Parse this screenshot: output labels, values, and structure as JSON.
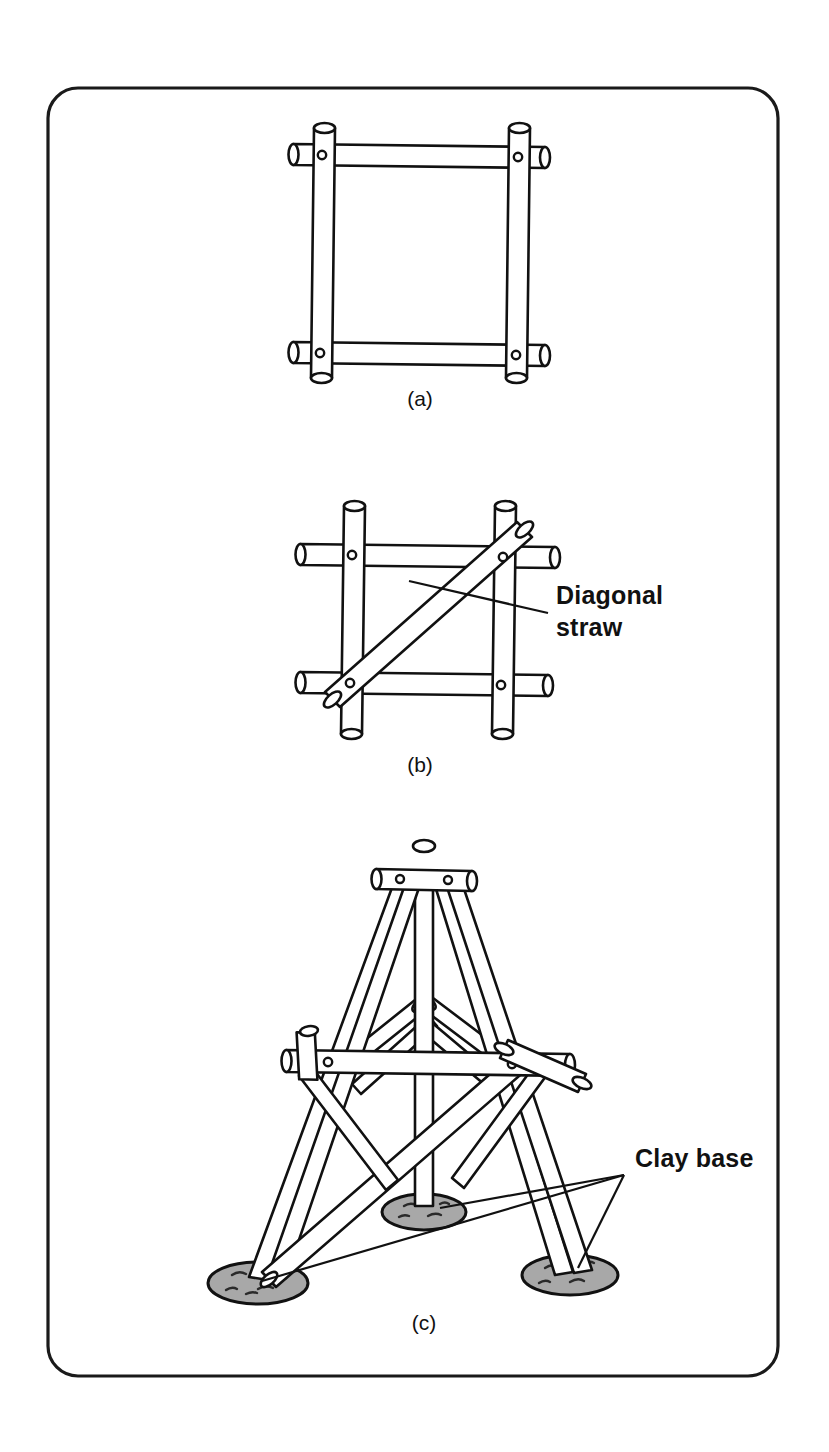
{
  "figure": {
    "border": {
      "x": 48,
      "y": 88,
      "width": 730,
      "height": 1288,
      "radius": 30,
      "color": "#1a1a1a"
    },
    "background": "#ffffff",
    "ink": "#111111",
    "clay_fill": "#a8a8a8"
  },
  "panels": [
    {
      "id": "a",
      "caption": "(a)",
      "caption_x": 420,
      "caption_y": 406,
      "description": "Square frame of four straws pinned at four corners"
    },
    {
      "id": "b",
      "caption": "(b)",
      "caption_x": 420,
      "caption_y": 772,
      "description": "Square frame of four straws with one diagonal straw brace"
    },
    {
      "id": "c",
      "caption": "(c)",
      "caption_x": 424,
      "caption_y": 1330,
      "description": "Three dimensional straw tower on three clay bases"
    }
  ],
  "annotations": [
    {
      "id": "diagonal-straw",
      "lines": [
        "Diagonal",
        "straw"
      ],
      "line1": "Diagonal",
      "line2": "straw",
      "text_x": 556,
      "text_y1": 604,
      "text_y2": 636,
      "leader_from_x": 548,
      "leader_from_y": 613,
      "leader_to_x": 409,
      "leader_to_y": 581
    },
    {
      "id": "clay-base",
      "lines": [
        "Clay base"
      ],
      "line1": "Clay base",
      "text_x": 635,
      "text_y": 1167,
      "leader_apex_x": 624,
      "leader_apex_y": 1175
    }
  ],
  "clay_bases": [
    {
      "id": "clay-base-center",
      "cx": 424,
      "cy": 1212,
      "rx": 42,
      "ry": 18
    },
    {
      "id": "clay-base-left",
      "cx": 258,
      "cy": 1283,
      "rx": 50,
      "ry": 21
    },
    {
      "id": "clay-base-right",
      "cx": 570,
      "cy": 1275,
      "rx": 48,
      "ry": 20
    }
  ]
}
